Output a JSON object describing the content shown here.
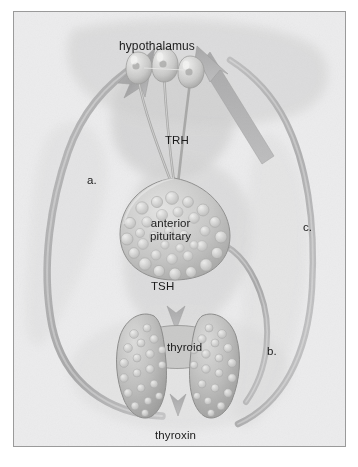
{
  "figure": {
    "style": "grayscale textbook illustration",
    "background_color": "#ececed",
    "border_color": "#9a9a9a",
    "text_color": "#1b1b1b"
  },
  "labels": {
    "hypothalamus": "hypothalamus",
    "trh": "TRH",
    "pituitary_line1": "anterior",
    "pituitary_line2": "pituitary",
    "tsh": "TSH",
    "thyroid": "thyroid",
    "thyroxin": "thyroxin",
    "a": "a.",
    "b": "b.",
    "c": "c."
  },
  "structures": [
    {
      "name": "hypothalamus-neurons",
      "label": "hypothalamus",
      "description": "three teardrop neuron cell bodies with long axons descending"
    },
    {
      "name": "anterior-pituitary",
      "label": "anterior pituitary",
      "description": "rounded gland with cellular bubbly texture"
    },
    {
      "name": "thyroid-gland",
      "label": "thyroid",
      "description": "butterfly shaped gland with two lobes and isthmus, follicular texture"
    }
  ],
  "arrows": [
    {
      "name": "trh-arrow",
      "from": "hypothalamus",
      "to": "anterior pituitary",
      "hormone": "TRH",
      "direction": "down"
    },
    {
      "name": "tsh-arrow",
      "from": "anterior pituitary",
      "to": "thyroid",
      "hormone": "TSH",
      "direction": "down"
    },
    {
      "name": "thyroxin-arrow",
      "from": "thyroid",
      "to": "thyroxin",
      "hormone": "thyroxin",
      "direction": "down"
    },
    {
      "name": "feedback-arrow-a",
      "letter": "a.",
      "to": "hypothalamus",
      "direction": "curved up-right"
    },
    {
      "name": "feedback-arrow-b",
      "letter": "b.",
      "to": "anterior pituitary",
      "direction": "curved up-left"
    },
    {
      "name": "feedback-arrow-c",
      "letter": "c.",
      "to": "hypothalamus",
      "direction": "straight diagonal up-left"
    }
  ]
}
